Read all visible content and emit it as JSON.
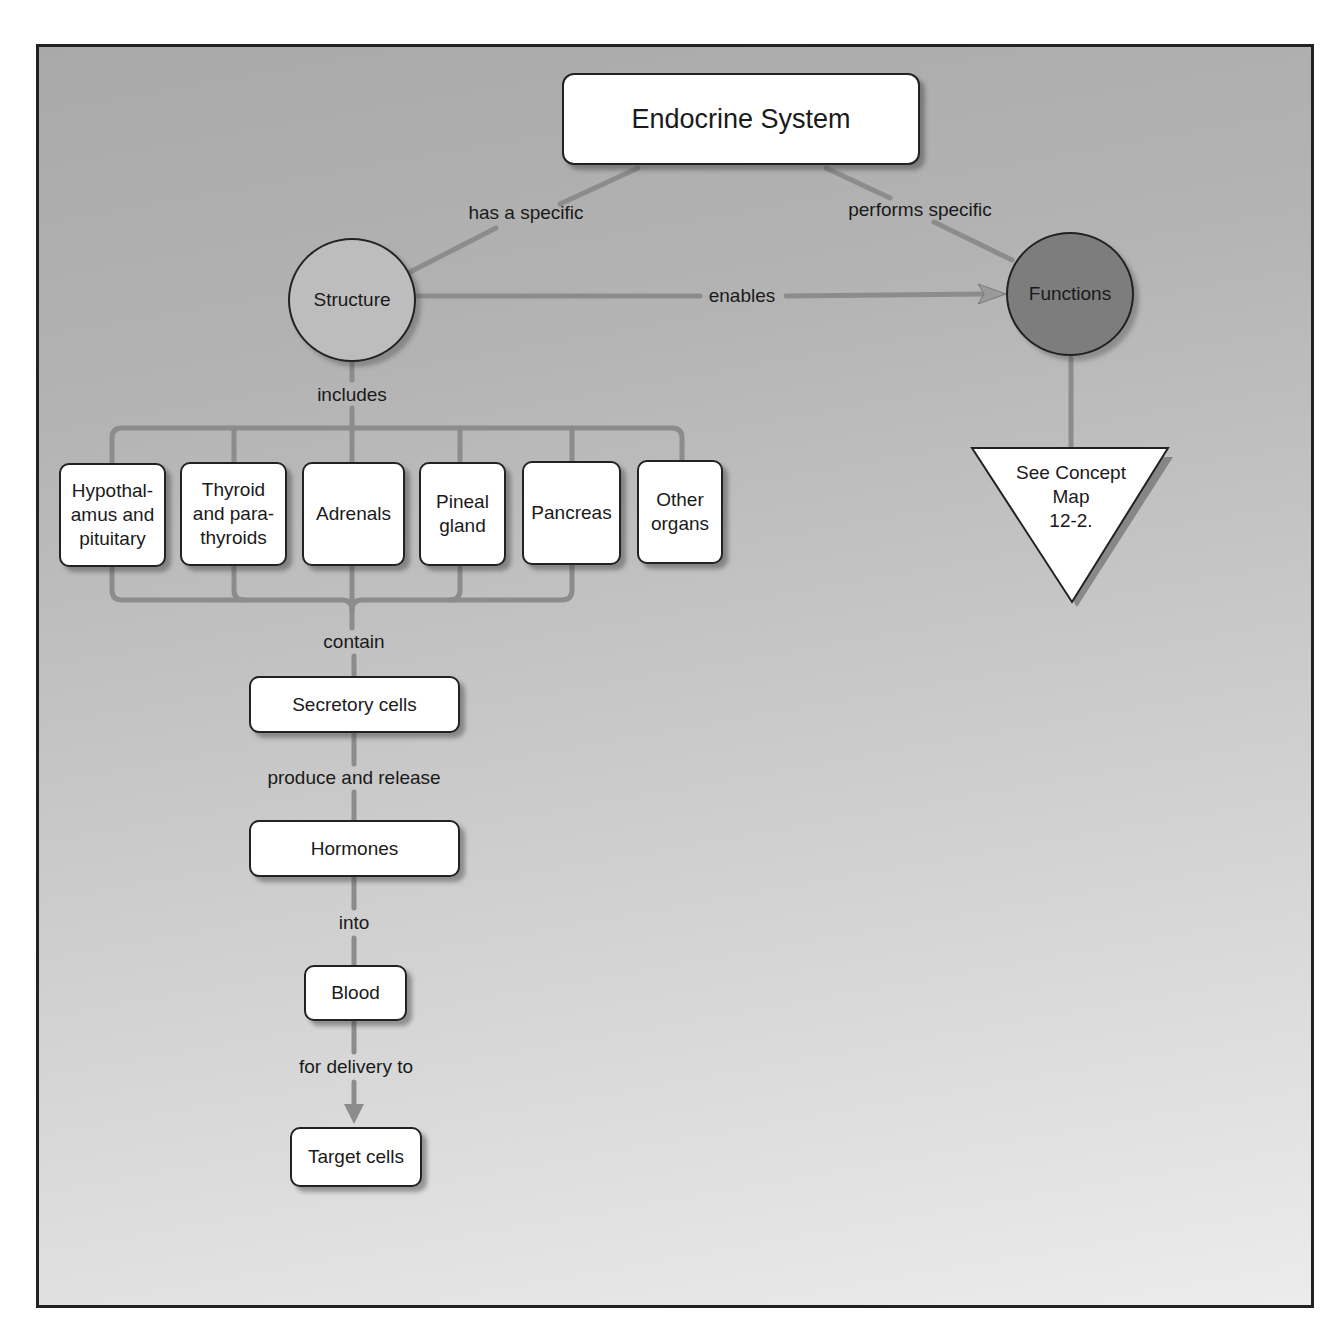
{
  "diagram": {
    "type": "concept_map",
    "title": "Endocrine System",
    "colors": {
      "background_top": "#a9a9a9",
      "background_bottom": "#ececec",
      "connector": "#8a8a8a",
      "structure_circle": "#bdbdbd",
      "functions_circle": "#7d7d7d",
      "node_fill": "#ffffff",
      "border": "#222222"
    },
    "nodes": {
      "root": "Endocrine System",
      "structure": "Structure",
      "functions": "Functions",
      "see_concept_map": [
        "See Concept",
        "Map",
        "12-2."
      ],
      "organs": [
        {
          "lines": [
            "Hypothal-",
            "amus and",
            "pituitary"
          ]
        },
        {
          "lines": [
            "Thyroid",
            "and para-",
            "thyroids"
          ]
        },
        {
          "lines": [
            "Adrenals"
          ]
        },
        {
          "lines": [
            "Pineal",
            "gland"
          ]
        },
        {
          "lines": [
            "Pancreas"
          ]
        },
        {
          "lines": [
            "Other",
            "organs"
          ]
        }
      ],
      "secretory_cells": "Secretory cells",
      "hormones": "Hormones",
      "blood": "Blood",
      "target_cells": "Target cells"
    },
    "links": {
      "has_a_specific": "has a specific",
      "performs_specific": "performs specific",
      "enables": "enables",
      "includes": "includes",
      "contain": "contain",
      "produce_and_release": "produce and release",
      "into": "into",
      "for_delivery_to": "for delivery to"
    },
    "edges": [
      {
        "from": "Endocrine System",
        "to": "Structure",
        "label": "has a specific"
      },
      {
        "from": "Endocrine System",
        "to": "Functions",
        "label": "performs specific"
      },
      {
        "from": "Structure",
        "to": "Functions",
        "label": "enables",
        "arrow": true
      },
      {
        "from": "Structure",
        "to": "Organs",
        "label": "includes"
      },
      {
        "from": "Organs",
        "to": "Secretory cells",
        "label": "contain"
      },
      {
        "from": "Secretory cells",
        "to": "Hormones",
        "label": "produce and release"
      },
      {
        "from": "Hormones",
        "to": "Blood",
        "label": "into"
      },
      {
        "from": "Blood",
        "to": "Target cells",
        "label": "for delivery to",
        "arrow": true
      },
      {
        "from": "Functions",
        "to": "See Concept Map 12-2."
      }
    ]
  }
}
